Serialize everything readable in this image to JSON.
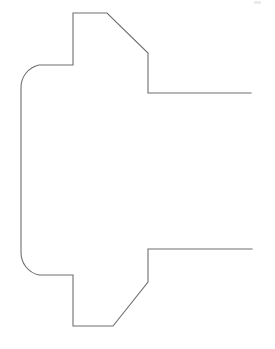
{
  "canvas": {
    "width": 275,
    "height": 349,
    "background_color": "#ffffff",
    "title": "Technical Outline Drawing"
  },
  "drawing": {
    "name": "machined-part-profile",
    "description": "Line-art outline of a symmetric machined part cross-section with rounded left end, two rectangular tabs, chamfered transitions and two open horizontal flange lines on the right",
    "stroke_color": "#6e6e6e",
    "stroke_width": 1.1,
    "fill": "none"
  },
  "geometry": {
    "units": "pixels",
    "upper_contour_points": [
      [
        251,
        93
      ],
      [
        148,
        93
      ],
      [
        148,
        53
      ],
      [
        107,
        13
      ],
      [
        73,
        13
      ],
      [
        73,
        65
      ],
      [
        39,
        65
      ]
    ],
    "left_upper_arc": {
      "type": "arc",
      "from": [
        39,
        65
      ],
      "to": [
        21,
        88
      ],
      "radius": 23,
      "sweep": "counterclockwise"
    },
    "left_vertical_points": [
      [
        21,
        88
      ],
      [
        21,
        252
      ]
    ],
    "left_lower_arc": {
      "type": "arc",
      "from": [
        21,
        252
      ],
      "to": [
        39,
        275
      ],
      "radius": 23,
      "sweep": "counterclockwise"
    },
    "lower_contour_points": [
      [
        39,
        275
      ],
      [
        73,
        275
      ],
      [
        73,
        326
      ],
      [
        113,
        326
      ],
      [
        148,
        282
      ],
      [
        148,
        249
      ],
      [
        252,
        249
      ]
    ]
  },
  "artifacts": {
    "speck": {
      "name": "scan-speck",
      "x": 254,
      "y": 1,
      "width": 7,
      "height": 3,
      "color": "#e7e7e7"
    }
  },
  "chart_data": {
    "type": "line",
    "xlabel": "",
    "ylabel": "",
    "xlim": [
      0,
      275
    ],
    "ylim": [
      349,
      0
    ],
    "grid": false,
    "legend": "none",
    "series": [
      {
        "name": "upper-profile",
        "x": [
          251,
          148,
          148,
          107,
          73,
          73,
          39
        ],
        "y": [
          93,
          93,
          53,
          13,
          13,
          65,
          65
        ]
      },
      {
        "name": "left-rounded-end",
        "x": [
          39,
          21,
          21,
          39
        ],
        "y": [
          65,
          88,
          252,
          275
        ]
      },
      {
        "name": "lower-profile",
        "x": [
          39,
          73,
          73,
          113,
          148,
          148,
          252
        ],
        "y": [
          275,
          275,
          326,
          326,
          282,
          249,
          249
        ]
      }
    ]
  }
}
